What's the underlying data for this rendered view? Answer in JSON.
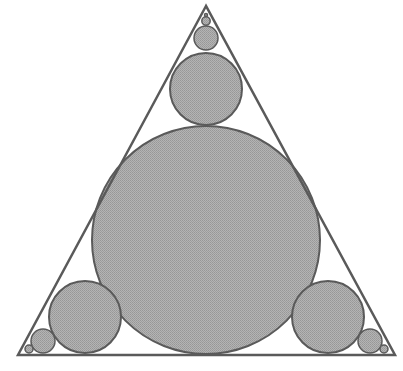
{
  "diagram": {
    "type": "geometry",
    "colors": {
      "background": "#ffffff",
      "circle_fill": "#a9a9a9",
      "stroke": "#5a5a5a"
    },
    "triangle": {
      "points": [
        [
          206,
          6
        ],
        [
          18,
          355
        ],
        [
          395,
          355
        ]
      ],
      "stroke_width": 2.5
    },
    "circles": [
      {
        "name": "incircle",
        "cx": 206,
        "cy": 240,
        "r": 114
      },
      {
        "name": "top-1",
        "cx": 206,
        "cy": 89,
        "r": 36
      },
      {
        "name": "top-2",
        "cx": 206,
        "cy": 38,
        "r": 12
      },
      {
        "name": "top-3",
        "cx": 206,
        "cy": 21,
        "r": 4.2
      },
      {
        "name": "top-4",
        "cx": 206,
        "cy": 15,
        "r": 1.5
      },
      {
        "name": "left-1",
        "cx": 85,
        "cy": 317,
        "r": 36
      },
      {
        "name": "left-2",
        "cx": 43,
        "cy": 341,
        "r": 12
      },
      {
        "name": "left-3",
        "cx": 29,
        "cy": 349,
        "r": 4
      },
      {
        "name": "right-1",
        "cx": 328,
        "cy": 317,
        "r": 36
      },
      {
        "name": "right-2",
        "cx": 370,
        "cy": 341,
        "r": 12
      },
      {
        "name": "right-3",
        "cx": 384,
        "cy": 349,
        "r": 4
      }
    ]
  }
}
